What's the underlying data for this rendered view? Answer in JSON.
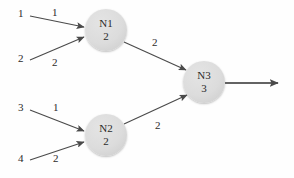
{
  "diagram": {
    "type": "neural-network-node-graph",
    "background_color": "#fefefe",
    "node_fill_color": "#dcdcdc",
    "edge_color": "#4a4a4a",
    "text_color": "#2b2b2b",
    "nodes": [
      {
        "id": "N1",
        "name": "N1",
        "value": "2",
        "cx": 106,
        "cy": 30,
        "r": 21
      },
      {
        "id": "N2",
        "name": "N2",
        "value": "2",
        "cx": 106,
        "cy": 135,
        "r": 21
      },
      {
        "id": "N3",
        "name": "N3",
        "value": "3",
        "cx": 204,
        "cy": 82,
        "r": 21
      }
    ],
    "inputs": [
      {
        "id": "in1",
        "label": "1",
        "weight": "1",
        "target": "N1"
      },
      {
        "id": "in2",
        "label": "2",
        "weight": "2",
        "target": "N1"
      },
      {
        "id": "in3",
        "label": "3",
        "weight": "1",
        "target": "N2"
      },
      {
        "id": "in4",
        "label": "4",
        "weight": "2",
        "target": "N2"
      }
    ],
    "edges": [
      {
        "id": "e-n1-n3",
        "from": "N1",
        "to": "N3",
        "weight": "2"
      },
      {
        "id": "e-n2-n3",
        "from": "N2",
        "to": "N3",
        "weight": "2"
      }
    ],
    "output": {
      "id": "out1",
      "from": "N3",
      "label": ""
    }
  }
}
